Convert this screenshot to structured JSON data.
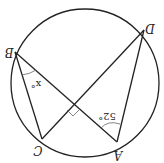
{
  "diagram": {
    "type": "circle-geometry",
    "orientation": "rotated-180",
    "points": {
      "A": {
        "label": "A"
      },
      "B": {
        "label": "B"
      },
      "C": {
        "label": "C"
      },
      "D": {
        "label": "D"
      }
    },
    "segments": [
      "B-C",
      "B-A",
      "C-D",
      "D-A"
    ],
    "angles": {
      "at_B": {
        "label": "x°"
      },
      "at_A": {
        "label": "52°"
      },
      "intersection": {
        "label": "right-angle"
      }
    },
    "colors": {
      "stroke": "#222222",
      "background": "#ffffff"
    }
  }
}
